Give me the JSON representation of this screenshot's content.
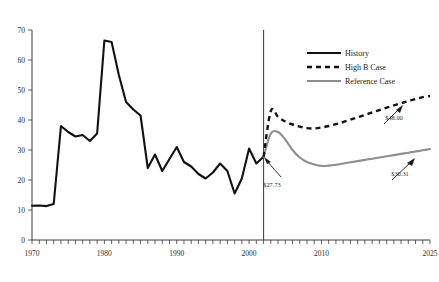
{
  "chart_data": {
    "type": "line",
    "title": "",
    "subtitle": "",
    "xlabel": "",
    "ylabel": "",
    "xlim": [
      1970,
      2025
    ],
    "ylim": [
      0,
      70
    ],
    "grid": false,
    "legend_position": "top-right",
    "y_ticks": [
      "0",
      "10",
      "20",
      "30",
      "40",
      "50",
      "60",
      "70"
    ],
    "y_tick_values": [
      0,
      10,
      20,
      30,
      40,
      50,
      60,
      70
    ],
    "x_ticks": [
      "1970",
      "1980",
      "1990",
      "2000",
      "2010",
      "2025"
    ],
    "x_tick_values": [
      1970,
      1980,
      1990,
      2000,
      2010,
      2025
    ],
    "x_minor_tick_step": 1,
    "projection_divider_year": 2002,
    "series": [
      {
        "name": "History",
        "style": "solid",
        "color": "#111111",
        "x": [
          1970,
          1971,
          1972,
          1973,
          1974,
          1975,
          1976,
          1977,
          1978,
          1979,
          1980,
          1981,
          1982,
          1983,
          1984,
          1985,
          1986,
          1987,
          1988,
          1989,
          1990,
          1991,
          1992,
          1993,
          1994,
          1995,
          1996,
          1997,
          1998,
          1999,
          2000,
          2001,
          2002
        ],
        "values": [
          11.4,
          11.5,
          11.3,
          12.0,
          38.0,
          36.0,
          34.5,
          35.0,
          33.0,
          35.5,
          66.5,
          66.0,
          55.0,
          46.0,
          43.5,
          41.5,
          24.0,
          28.5,
          23.0,
          27.0,
          31.0,
          26.0,
          24.5,
          22.0,
          20.5,
          22.5,
          25.5,
          23.0,
          15.5,
          20.5,
          30.5,
          25.5,
          27.73
        ]
      },
      {
        "name": "High B Case",
        "style": "dashed",
        "color": "#111111",
        "x": [
          2002,
          2003,
          2004,
          2005,
          2006,
          2007,
          2008,
          2009,
          2010,
          2011,
          2012,
          2013,
          2014,
          2015,
          2016,
          2017,
          2018,
          2019,
          2020,
          2021,
          2022,
          2023,
          2024,
          2025
        ],
        "values": [
          27.73,
          43.0,
          41.0,
          39.5,
          38.5,
          37.8,
          37.3,
          37.2,
          37.5,
          38.0,
          38.6,
          39.3,
          40.1,
          40.9,
          41.7,
          42.5,
          43.3,
          44.1,
          44.9,
          45.6,
          46.3,
          47.0,
          47.6,
          48.0
        ]
      },
      {
        "name": "Reference Case",
        "style": "solid",
        "color": "#8e8e8e",
        "x": [
          2002,
          2003,
          2004,
          2005,
          2006,
          2007,
          2008,
          2009,
          2010,
          2011,
          2012,
          2013,
          2014,
          2015,
          2016,
          2017,
          2018,
          2019,
          2020,
          2021,
          2022,
          2023,
          2024,
          2025
        ],
        "values": [
          27.73,
          35.5,
          36.0,
          33.5,
          30.0,
          27.5,
          26.0,
          25.2,
          24.7,
          24.8,
          25.1,
          25.5,
          25.9,
          26.3,
          26.7,
          27.1,
          27.5,
          27.9,
          28.3,
          28.7,
          29.1,
          29.5,
          29.9,
          30.31
        ]
      }
    ],
    "annotations": [
      {
        "id": "history-end-value",
        "label": "$27.73",
        "target_year": 2002,
        "target_value": 27.73
      },
      {
        "id": "high-b-end-value",
        "label": "$48.00",
        "target_year": 2025,
        "target_value": 48.0
      },
      {
        "id": "reference-end-value",
        "label": "$30.31",
        "target_year": 2025,
        "target_value": 30.31
      }
    ]
  },
  "legend": {
    "items": [
      {
        "label": "History"
      },
      {
        "label": "High B Case"
      },
      {
        "label": "Reference Case"
      }
    ]
  }
}
